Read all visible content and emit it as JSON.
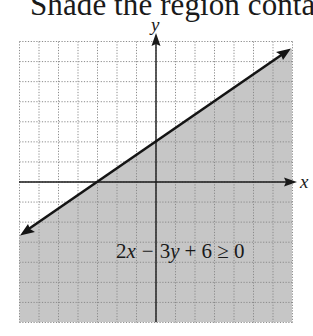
{
  "title": "Shade the region containing",
  "graph": {
    "x_label": "x",
    "y_label": "y",
    "inequality": "2x − 3y + 6 ≥ 0",
    "inequality_parts": {
      "term1": "2",
      "var1": "x",
      "op1": "−",
      "term2": "3",
      "var2": "y",
      "rest": "+ 6 ≥ 0"
    },
    "x_range": [
      -7,
      7
    ],
    "y_range": [
      -7,
      7
    ],
    "boundary_line": {
      "equation": "y = (2x + 6) / 3",
      "slope": 0.6667,
      "y_intercept": 2,
      "x_intercept": -3,
      "style": "solid"
    },
    "shaded_side": "below",
    "colors": {
      "shade": "#c6c6c6",
      "grid": "#8a8a8a",
      "axis": "#1a1a1a",
      "line": "#141414",
      "background": "#ffffff"
    }
  }
}
